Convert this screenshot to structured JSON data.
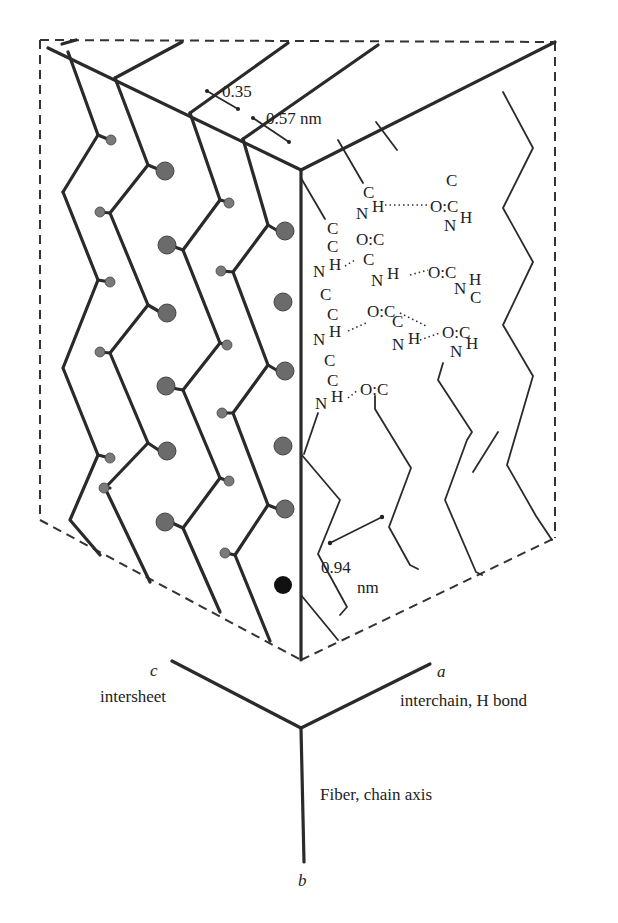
{
  "diagram": {
    "dimensions": {
      "intersheet_spacing": "0.35",
      "interchain_spacing": "0.57 nm",
      "repeat_distance_value": "0.94",
      "repeat_distance_unit": "nm"
    },
    "atoms": {
      "carbon": "C",
      "nitrogen": "N",
      "oxygen": "O",
      "hydrogen": "H",
      "carbonyl": "O:C"
    },
    "axes": {
      "c": {
        "letter": "c",
        "label": "intersheet"
      },
      "a": {
        "letter": "a",
        "label": "interchain, H bond"
      },
      "b": {
        "letter": "b",
        "label": "Fiber, chain axis"
      }
    },
    "colors": {
      "line": "#2a2a2a",
      "side_chain_atom": "#6b6b6b",
      "highlight_atom": "#111111",
      "background": "#ffffff"
    }
  }
}
